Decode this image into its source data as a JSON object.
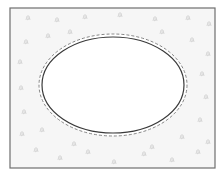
{
  "diagram": {
    "type": "site-plan",
    "frame": {
      "x": 10,
      "y": 8,
      "width": 205,
      "height": 160,
      "stroke": "#6e6e6e"
    },
    "lawn": {
      "fill": "#f6f6f6",
      "texture_color": "#d4d4d4"
    },
    "pool": {
      "cx": 113,
      "cy": 85,
      "rx": 71,
      "ry": 48,
      "fill": "#ffffff",
      "stroke": "#3a3a3a"
    },
    "offset_outline": {
      "offset": 3,
      "stroke": "#777777",
      "dash": "3 2"
    },
    "tufts": [
      [
        26,
        16
      ],
      [
        55,
        18
      ],
      [
        83,
        15
      ],
      [
        118,
        13
      ],
      [
        153,
        17
      ],
      [
        186,
        16
      ],
      [
        207,
        22
      ],
      [
        24,
        40
      ],
      [
        46,
        34
      ],
      [
        68,
        30
      ],
      [
        160,
        30
      ],
      [
        190,
        38
      ],
      [
        206,
        52
      ],
      [
        18,
        60
      ],
      [
        19,
        86
      ],
      [
        22,
        110
      ],
      [
        20,
        132
      ],
      [
        200,
        72
      ],
      [
        204,
        95
      ],
      [
        198,
        118
      ],
      [
        206,
        140
      ],
      [
        34,
        148
      ],
      [
        58,
        156
      ],
      [
        86,
        150
      ],
      [
        112,
        160
      ],
      [
        142,
        152
      ],
      [
        170,
        158
      ],
      [
        196,
        150
      ],
      [
        40,
        128
      ],
      [
        180,
        135
      ],
      [
        150,
        145
      ],
      [
        72,
        142
      ]
    ]
  }
}
